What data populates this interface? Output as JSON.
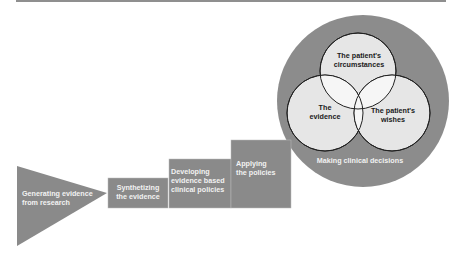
{
  "diagram": {
    "colors": {
      "shape_fill": "#8a8a8a",
      "outer_circle": "#8c8c8c",
      "inner_circle": "#e4e4e4",
      "overlap": "#f4f4f4",
      "text_light": "#f2f2f2",
      "text_dark": "#1a1a1a",
      "rule": "#8f8f8f"
    },
    "steps": [
      {
        "line1": "Generating evidence",
        "line2": "from research"
      },
      {
        "line1": "Synthetizing",
        "line2": "the evidence"
      },
      {
        "line1": "Developing",
        "line2": "evidence based",
        "line3": "clinical policies"
      },
      {
        "line1": "Applying",
        "line2": "the policies"
      }
    ],
    "decision": {
      "label": "Making clinical decisions",
      "circles": [
        {
          "line1": "The patient's",
          "line2": "circumstances"
        },
        {
          "line1": "The",
          "line2": "evidence"
        },
        {
          "line1": "The patient's",
          "line2": "wishes"
        }
      ]
    }
  }
}
